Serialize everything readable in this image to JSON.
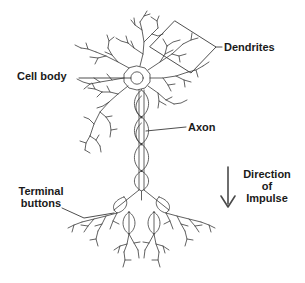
{
  "diagram": {
    "type": "line-drawing",
    "background_color": "#ffffff",
    "ink_color": "#3a3a3a",
    "text_color": "#1a1a1a",
    "labels": {
      "dendrites": "Dendrites",
      "cell_body": "Cell body",
      "axon": "Axon",
      "terminal_buttons_line1": "Terminal",
      "terminal_buttons_line2": "buttons",
      "direction_line1": "Direction",
      "direction_line2": "of",
      "direction_line3": "Impulse"
    }
  }
}
